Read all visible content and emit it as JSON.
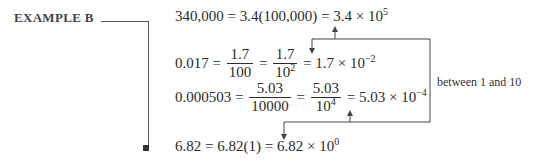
{
  "example": {
    "label": "EXAMPLE B",
    "end_marker": "end-of-example-square"
  },
  "equations": [
    {
      "lhs": "340,000",
      "step1": "3.4(100,000)",
      "result_coef": "3.4",
      "times": "×",
      "base": "10",
      "exponent": "5"
    },
    {
      "lhs": "0.017",
      "frac1_num": "1.7",
      "frac1_den": "100",
      "frac2_num": "1.7",
      "frac2_den_base": "10",
      "frac2_den_exp": "2",
      "result_coef": "1.7",
      "times": "×",
      "base": "10",
      "exponent": "−2"
    },
    {
      "lhs": "0.000503",
      "frac1_num": "5.03",
      "frac1_den": "10000",
      "frac2_num": "5.03",
      "frac2_den_base": "10",
      "frac2_den_exp": "4",
      "result_coef": "5.03",
      "times": "×",
      "base": "10",
      "exponent": "−4"
    },
    {
      "lhs": "6.82",
      "step1": "6.82(1)",
      "result_coef": "6.82",
      "times": "×",
      "base": "10",
      "exponent": "0"
    }
  ],
  "annotation": {
    "text": "between 1 and 10"
  },
  "symbols": {
    "equals": "="
  }
}
